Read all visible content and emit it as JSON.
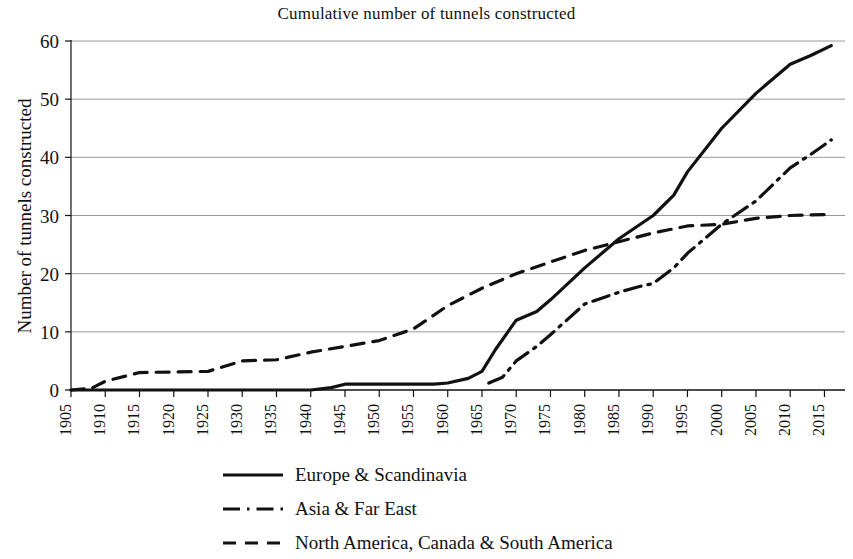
{
  "chart_data": {
    "type": "line",
    "title": "Cumulative number of tunnels constructed",
    "xlabel": "",
    "ylabel": "Number of tunnels constructed",
    "xlim": [
      1905,
      2018
    ],
    "ylim": [
      0,
      60
    ],
    "ytick_values": [
      0,
      10,
      20,
      30,
      40,
      50,
      60
    ],
    "ytick_labels": [
      "0",
      "10",
      "20",
      "30",
      "40",
      "50",
      "60"
    ],
    "xtick_values": [
      1905,
      1910,
      1915,
      1920,
      1925,
      1930,
      1935,
      1940,
      1945,
      1950,
      1955,
      1960,
      1965,
      1970,
      1975,
      1980,
      1985,
      1990,
      1995,
      2000,
      2005,
      2010,
      2015
    ],
    "xtick_labels": [
      "1905",
      "1910",
      "1915",
      "1920",
      "1925",
      "1930",
      "1935",
      "1940",
      "1945",
      "1950",
      "1955",
      "1960",
      "1965",
      "1970",
      "1975",
      "1980",
      "1985",
      "1990",
      "1995",
      "2000",
      "2005",
      "2010",
      "2015"
    ],
    "grid": "horizontal",
    "grid_color": "#9a9a9a",
    "axis_color": "#111111",
    "legend_position": "below",
    "series": [
      {
        "name": "Europe & Scandinavia",
        "style": "solid",
        "color": "#111111",
        "x": [
          1905,
          1910,
          1915,
          1920,
          1925,
          1930,
          1935,
          1940,
          1943,
          1945,
          1950,
          1955,
          1958,
          1960,
          1963,
          1965,
          1967,
          1970,
          1973,
          1975,
          1980,
          1985,
          1990,
          1993,
          1995,
          2000,
          2005,
          2010,
          2013,
          2016
        ],
        "values": [
          0,
          0,
          0,
          0,
          0,
          0,
          0,
          0,
          0.4,
          1,
          1,
          1,
          1,
          1.2,
          2,
          3.2,
          7,
          12,
          13.5,
          15.5,
          21,
          26,
          30,
          33.5,
          37.5,
          45,
          51,
          56,
          57.5,
          59.2
        ]
      },
      {
        "name": "Asia & Far East",
        "style": "dashdot",
        "color": "#111111",
        "x": [
          1966,
          1968,
          1970,
          1973,
          1975,
          1980,
          1985,
          1988,
          1990,
          1993,
          1995,
          2000,
          2005,
          2010,
          2013,
          2016
        ],
        "values": [
          1.2,
          2.2,
          5,
          7.5,
          9.5,
          14.8,
          16.8,
          17.8,
          18.3,
          21,
          23.5,
          28.5,
          32.5,
          38.2,
          40.5,
          43
        ]
      },
      {
        "name": "North America, Canada & South America",
        "style": "dashed",
        "color": "#111111",
        "x": [
          1905,
          1908,
          1910,
          1915,
          1920,
          1925,
          1930,
          1935,
          1940,
          1945,
          1950,
          1955,
          1960,
          1965,
          1970,
          1975,
          1980,
          1985,
          1990,
          1995,
          2000,
          2005,
          2010,
          2016
        ],
        "values": [
          0,
          0.3,
          1.5,
          3,
          3.1,
          3.2,
          5,
          5.2,
          6.5,
          7.5,
          8.5,
          10.5,
          14.5,
          17.5,
          20,
          22,
          24,
          25.5,
          27,
          28.2,
          28.5,
          29.5,
          30,
          30.2
        ]
      }
    ]
  },
  "legend": {
    "items": [
      {
        "label": "Europe & Scandinavia",
        "style": "solid"
      },
      {
        "label": "Asia & Far East",
        "style": "dashdot"
      },
      {
        "label": "North America, Canada & South America",
        "style": "dashed"
      }
    ]
  }
}
